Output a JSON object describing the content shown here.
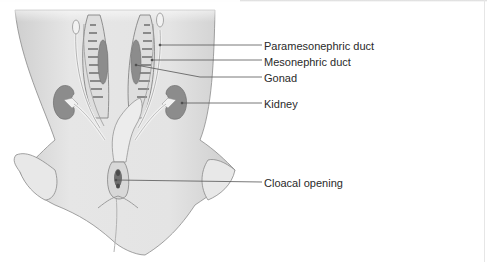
{
  "figure": {
    "type": "anatomical illustration",
    "colors": {
      "skin": "#e2e2e2",
      "skin_shade": "#c9c9c9",
      "organ": "#8c8c8c",
      "organ_dark": "#6f6f6f",
      "duct": "#f2f2f2",
      "outline": "#7a7a7a",
      "leader": "#555555",
      "text": "#2a2a2a"
    }
  },
  "labels": [
    {
      "id": "paramesonephric-duct",
      "text": "Paramesonephric duct"
    },
    {
      "id": "mesonephric-duct",
      "text": "Mesonephric duct"
    },
    {
      "id": "gonad",
      "text": "Gonad"
    },
    {
      "id": "kidney",
      "text": "Kidney"
    },
    {
      "id": "cloacal-opening",
      "text": "Cloacal opening"
    }
  ]
}
